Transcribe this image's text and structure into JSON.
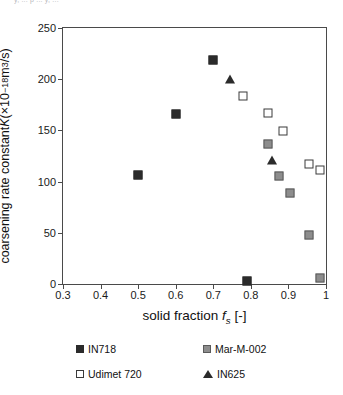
{
  "figure": {
    "clipped_header_text": "y, ... p ... y, ...",
    "background_color": "#ffffff"
  },
  "chart_data": {
    "type": "scatter",
    "title": "",
    "xlabel": "solid fraction f_s [-]",
    "ylabel": "coarsening rate constant K (×10^-18 m^3/s)",
    "xlim": [
      0.3,
      1.0
    ],
    "ylim": [
      0,
      250
    ],
    "xticks": [
      0.3,
      0.4,
      0.5,
      0.6,
      0.7,
      0.8,
      0.9,
      1
    ],
    "xticklabels": [
      "0.3",
      "0.4",
      "0.5",
      "0.6",
      "0.7",
      "0.8",
      "0.9",
      "1"
    ],
    "yticks": [
      0,
      50,
      100,
      150,
      200,
      250
    ],
    "yticklabels": [
      "0",
      "50",
      "100",
      "150",
      "200",
      "250"
    ],
    "grid": false,
    "legend_position": "below-plot",
    "series": [
      {
        "name": "IN718",
        "marker": "filled-square",
        "color": "#2b2b2b",
        "points": [
          {
            "x": 0.5,
            "y": 106
          },
          {
            "x": 0.6,
            "y": 166
          },
          {
            "x": 0.7,
            "y": 219
          },
          {
            "x": 0.79,
            "y": 3
          }
        ]
      },
      {
        "name": "Mar-M-002",
        "marker": "gray-square",
        "color": "#8d8d8d",
        "points": [
          {
            "x": 0.845,
            "y": 137
          },
          {
            "x": 0.875,
            "y": 105
          },
          {
            "x": 0.905,
            "y": 89
          },
          {
            "x": 0.955,
            "y": 48
          },
          {
            "x": 0.985,
            "y": 6
          }
        ]
      },
      {
        "name": "Udimet 720",
        "marker": "open-square",
        "color": "#ffffff",
        "points": [
          {
            "x": 0.78,
            "y": 184
          },
          {
            "x": 0.845,
            "y": 167
          },
          {
            "x": 0.885,
            "y": 149
          },
          {
            "x": 0.955,
            "y": 117
          },
          {
            "x": 0.985,
            "y": 111
          }
        ]
      },
      {
        "name": "IN625",
        "marker": "filled-triangle",
        "color": "#2b2b2b",
        "points": [
          {
            "x": 0.745,
            "y": 200
          },
          {
            "x": 0.855,
            "y": 121
          }
        ]
      }
    ]
  },
  "legend": {
    "items": [
      {
        "label": "IN718",
        "marker": "filled-square"
      },
      {
        "label": "Mar-M-002",
        "marker": "gray-square"
      },
      {
        "label": "Udimet 720",
        "marker": "open-square"
      },
      {
        "label": "IN625",
        "marker": "filled-triangle"
      }
    ]
  },
  "axis_title_parts": {
    "y_prefix": "coarsening rate constant ",
    "y_symbol": "K",
    "y_units_open": " (×10",
    "y_units_exp": "−18",
    "y_units_mid": " m",
    "y_units_exp2": "3",
    "y_units_close": "/s)",
    "x_prefix": "solid fraction ",
    "x_symbol": "f",
    "x_sub": "s",
    "x_suffix": " [-]"
  }
}
